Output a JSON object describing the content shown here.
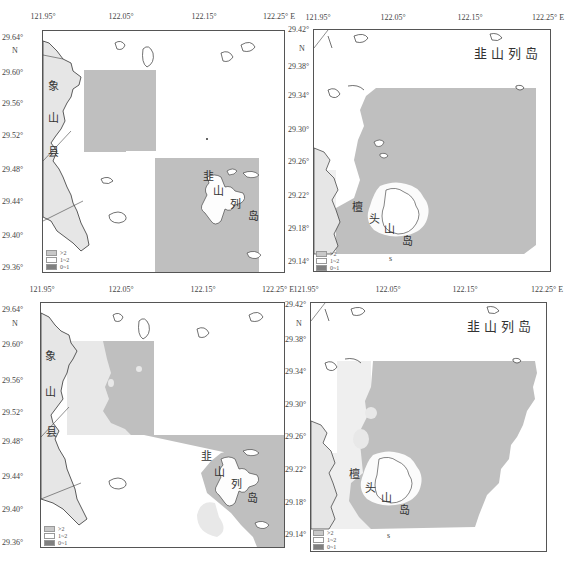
{
  "figure": {
    "colors": {
      "frame": "#555555",
      "class_gt2": "#bfbfbf",
      "class_1_2": "#ffffff",
      "class_0_1": "#7f7f7f",
      "land": "#e6e6e6",
      "coast": "#333333"
    },
    "legend": [
      {
        "label": ">2",
        "color": "#c8c8c8"
      },
      {
        "label": "1~2",
        "color": "#ffffff"
      },
      {
        "label": "0~1",
        "color": "#808080"
      }
    ],
    "panels": [
      {
        "id": "top-left",
        "x_ticks": [
          "121.95°",
          "122.05°",
          "122.15°",
          "122.25° E"
        ],
        "y_ticks": [
          "29.64°",
          "29.60°",
          "29.56°",
          "29.52°",
          "29.48°",
          "29.44°",
          "29.40°",
          "29.36°"
        ],
        "north_label": "N",
        "places": {
          "xiangshan": [
            "象",
            "山",
            "县"
          ],
          "jiushan": [
            "韭",
            "山",
            "列",
            "岛"
          ]
        }
      },
      {
        "id": "top-right",
        "x_ticks": [
          "121.95°",
          "122.05°",
          "122.15°",
          "122.25° E"
        ],
        "y_ticks": [
          "29.42°",
          "29.38°",
          "29.34°",
          "29.30°",
          "29.26°",
          "29.22°",
          "29.18°",
          "29.14°"
        ],
        "north_label": "N",
        "places": {
          "jiushan_title": "韭山列岛",
          "tantou": [
            "檀",
            "头",
            "山",
            "岛"
          ]
        },
        "bottom_letter": "s"
      },
      {
        "id": "bottom-left",
        "x_ticks": [
          "121.95°",
          "122.05°",
          "122.15°",
          "122.25° E"
        ],
        "y_ticks": [
          "29.64°",
          "29.60°",
          "29.56°",
          "29.52°",
          "29.48°",
          "29.44°",
          "29.40°",
          "29.36°"
        ],
        "north_label": "N",
        "places": {
          "xiangshan": [
            "象",
            "山",
            "县"
          ],
          "jiushan": [
            "韭",
            "山",
            "列",
            "岛"
          ]
        }
      },
      {
        "id": "bottom-right",
        "x_ticks": [
          "121.95°",
          "122.05°",
          "122.15°",
          "122.25° E"
        ],
        "y_ticks": [
          "29.42°",
          "29.38°",
          "29.34°",
          "29.30°",
          "29.26°",
          "29.22°",
          "29.18°",
          "29.14°"
        ],
        "north_label": "N",
        "places": {
          "jiushan_title": "韭山列岛",
          "tantou": [
            "檀",
            "头",
            "山",
            "岛"
          ]
        },
        "bottom_letter": "s"
      }
    ]
  }
}
